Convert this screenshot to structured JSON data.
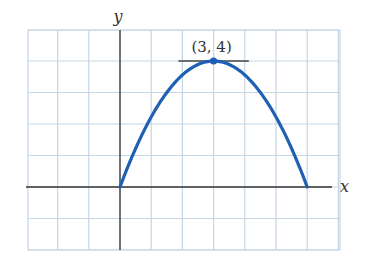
{
  "chart_data": {
    "type": "line",
    "title": "",
    "xlabel": "x",
    "ylabel": "y",
    "xlim": [
      -3,
      7
    ],
    "ylim": [
      -2,
      5
    ],
    "grid": true,
    "grid_step": 1,
    "tick_labels": false,
    "legend": null,
    "series": [
      {
        "name": "parabola",
        "equation": "y = -4/9 (x - 3)^2 + 4",
        "color": "#1f5fb4",
        "x": [
          0,
          0.5,
          1,
          1.5,
          2,
          2.5,
          3,
          3.5,
          4,
          4.5,
          5,
          5.5,
          6
        ],
        "y": [
          0,
          1.222,
          2.222,
          3,
          3.556,
          3.889,
          4,
          3.889,
          3.556,
          3,
          2.222,
          1.222,
          0
        ]
      }
    ],
    "annotations": [
      {
        "type": "point",
        "x": 3,
        "y": 4,
        "label": "(3, 4)"
      },
      {
        "type": "horizontal_tangent",
        "y": 4,
        "x_range": [
          2,
          4
        ]
      }
    ]
  },
  "labels": {
    "x_axis": "x",
    "y_axis": "y",
    "vertex": "(3, 4)"
  },
  "colors": {
    "grid": "#c5d6e6",
    "axis": "#333333",
    "curve": "#1f5fb4",
    "tangent": "#444444"
  }
}
